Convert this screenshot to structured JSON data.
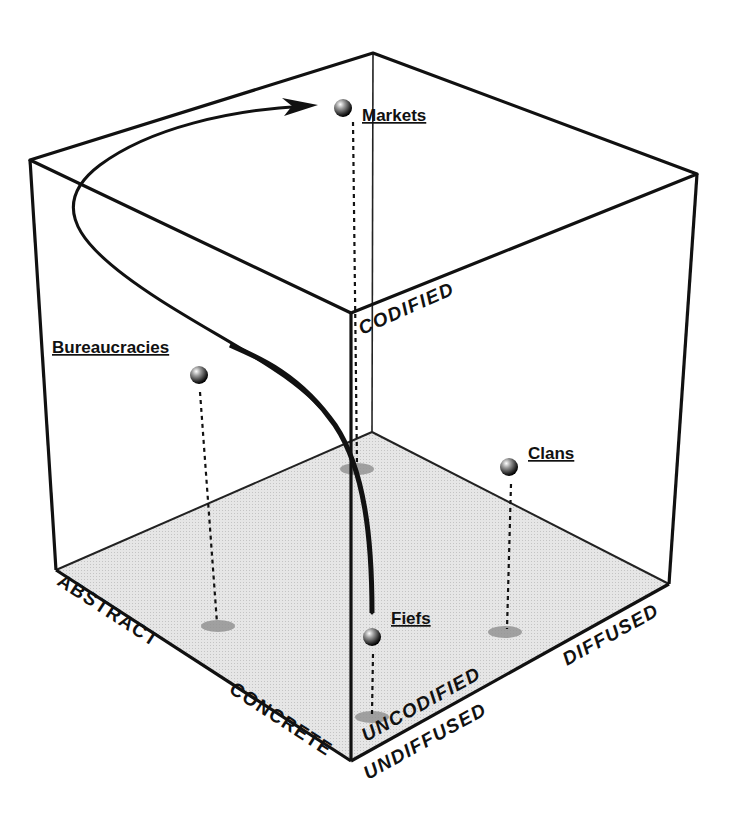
{
  "diagram": {
    "type": "3d-cube-information-space",
    "colors": {
      "edge": "#111111",
      "floor": "#e2e2e2",
      "shadow": "#9a9a9a",
      "background": "#ffffff"
    },
    "axes": {
      "abstraction": {
        "high": "ABSTRACT",
        "low": "CONCRETE"
      },
      "codification": {
        "high": "CODIFIED",
        "low": "UNCODIFIED"
      },
      "diffusion": {
        "high": "DIFFUSED",
        "low": "UNDIFFUSED"
      }
    },
    "nodes": [
      {
        "id": "markets",
        "label": "Markets"
      },
      {
        "id": "bureaucracies",
        "label": "Bureaucracies"
      },
      {
        "id": "clans",
        "label": "Clans"
      },
      {
        "id": "fiefs",
        "label": "Fiefs"
      }
    ],
    "path": {
      "from": "Fiefs",
      "via": "Bureaucracies",
      "to": "Markets",
      "arrow": true
    }
  }
}
